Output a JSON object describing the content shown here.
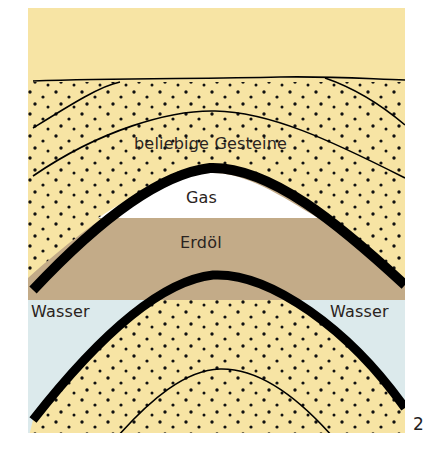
{
  "diagram": {
    "type": "geological-trap-cross-section",
    "labels": {
      "rock": "beliebige Gesteine",
      "gas": "Gas",
      "oil": "Erdöl",
      "water_left": "Wasser",
      "water_right": "Wasser"
    },
    "figure_number": "2",
    "colors": {
      "sand": "#f7e4a4",
      "oil": "#c3ab88",
      "gas": "#ffffff",
      "water": "#dceaec",
      "cap_rock": "#000000"
    }
  }
}
